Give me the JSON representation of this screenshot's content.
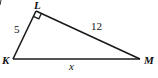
{
  "diagram": {
    "type": "right-triangle",
    "vertices": [
      {
        "id": "L",
        "label": "L",
        "x": 36,
        "y": 11
      },
      {
        "id": "K",
        "label": "K",
        "x": 13,
        "y": 59
      },
      {
        "id": "M",
        "label": "M",
        "x": 140,
        "y": 59
      }
    ],
    "right_angle_at": "L",
    "sides": [
      {
        "from": "K",
        "to": "L",
        "label": "5"
      },
      {
        "from": "L",
        "to": "M",
        "label": "12"
      },
      {
        "from": "K",
        "to": "M",
        "label": "x"
      }
    ],
    "colors": {
      "stroke": "#1a1a1a",
      "background": "#ffffff"
    }
  }
}
